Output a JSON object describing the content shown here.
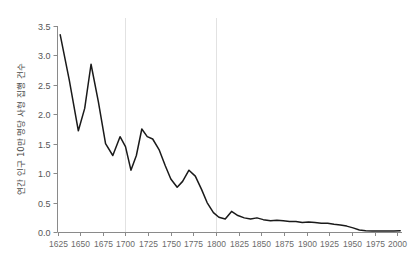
{
  "chart_data": {
    "type": "line",
    "title": "",
    "subtitle": "",
    "xlabel": "",
    "ylabel": "연간 인구 10만 명당 사형 집행 건수",
    "xlim": [
      1625,
      2005
    ],
    "ylim": [
      0.0,
      3.5
    ],
    "grid": "vertical-only",
    "legend": "none",
    "line_color": "#1a1a1a",
    "gridline_color": "#e2e2e2",
    "axis_color": "#8a8a8a",
    "background_color": "#ffffff",
    "xticks": [
      1625,
      1650,
      1675,
      1700,
      1725,
      1750,
      1775,
      1800,
      1825,
      1850,
      1875,
      1900,
      1925,
      1950,
      1975,
      2000
    ],
    "xtick_labels": [
      "1625",
      "1650",
      "1675",
      "1700",
      "1725",
      "1750",
      "1775",
      "1800",
      "1825",
      "1850",
      "1875",
      "1900",
      "1925",
      "1950",
      "1975",
      "2000"
    ],
    "yticks": [
      0.0,
      0.5,
      1.0,
      1.5,
      2.0,
      2.5,
      3.0,
      3.5
    ],
    "ytick_labels": [
      "0.0",
      "0.5",
      "1.0",
      "1.5",
      "2.0",
      "2.5",
      "3.0",
      "3.5"
    ],
    "vertical_gridlines": [
      1700,
      1800
    ],
    "series": [
      {
        "name": "executions-per-100k",
        "x": [
          1628,
          1638,
          1648,
          1655,
          1662,
          1670,
          1678,
          1686,
          1694,
          1700,
          1706,
          1712,
          1718,
          1724,
          1730,
          1737,
          1744,
          1750,
          1757,
          1763,
          1770,
          1777,
          1784,
          1790,
          1797,
          1803,
          1810,
          1817,
          1824,
          1831,
          1838,
          1845,
          1852,
          1860,
          1867,
          1874,
          1881,
          1888,
          1895,
          1902,
          1909,
          1916,
          1923,
          1930,
          1937,
          1944,
          1951,
          1958,
          1965,
          1972,
          1980,
          1988,
          1996,
          2003
        ],
        "y": [
          3.35,
          2.58,
          1.72,
          2.1,
          2.85,
          2.22,
          1.5,
          1.3,
          1.62,
          1.45,
          1.05,
          1.3,
          1.75,
          1.62,
          1.58,
          1.4,
          1.12,
          0.9,
          0.76,
          0.86,
          1.05,
          0.95,
          0.72,
          0.5,
          0.33,
          0.25,
          0.22,
          0.35,
          0.28,
          0.24,
          0.22,
          0.24,
          0.21,
          0.19,
          0.2,
          0.19,
          0.18,
          0.18,
          0.16,
          0.17,
          0.16,
          0.15,
          0.15,
          0.13,
          0.12,
          0.1,
          0.07,
          0.035,
          0.02,
          0.018,
          0.018,
          0.018,
          0.018,
          0.02
        ]
      }
    ]
  }
}
